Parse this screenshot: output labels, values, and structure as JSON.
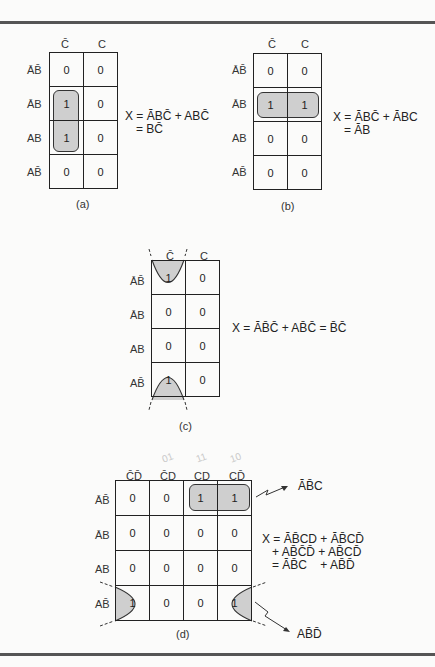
{
  "figure": {
    "panels": [
      {
        "id": "a",
        "caption": "(a)",
        "columns": [
          "C̄",
          "C"
        ],
        "rows": [
          "ĀB̄",
          "ĀB",
          "AB",
          "AB̄"
        ],
        "cells": [
          [
            "0",
            "0"
          ],
          [
            "1",
            "0"
          ],
          [
            "1",
            "0"
          ],
          [
            "0",
            "0"
          ]
        ],
        "expression": [
          "X = ĀBC̄ + ABC̄",
          "= BC̄"
        ]
      },
      {
        "id": "b",
        "caption": "(b)",
        "columns": [
          "C̄",
          "C"
        ],
        "rows": [
          "ĀB̄",
          "ĀB",
          "AB",
          "AB̄"
        ],
        "cells": [
          [
            "0",
            "0"
          ],
          [
            "1",
            "1"
          ],
          [
            "0",
            "0"
          ],
          [
            "0",
            "0"
          ]
        ],
        "expression": [
          "X = ĀBC̄ + ĀBC",
          "= ĀB"
        ]
      },
      {
        "id": "c",
        "caption": "(c)",
        "columns": [
          "C̄",
          "C"
        ],
        "rows": [
          "ĀB̄",
          "ĀB",
          "AB",
          "AB̄"
        ],
        "cells": [
          [
            "1",
            "0"
          ],
          [
            "0",
            "0"
          ],
          [
            "0",
            "0"
          ],
          [
            "1",
            "0"
          ]
        ],
        "expression": [
          "X = ĀB̄C̄ + AB̄C̄ = B̄C̄"
        ]
      },
      {
        "id": "d",
        "caption": "(d)",
        "columns": [
          "C̄D̄",
          "C̄D",
          "CD",
          "CD̄"
        ],
        "column_annotations": [
          "01",
          "11",
          "10"
        ],
        "rows": [
          "ĀB̄",
          "ĀB",
          "AB",
          "AB̄"
        ],
        "cells": [
          [
            "0",
            "0",
            "1",
            "1"
          ],
          [
            "0",
            "0",
            "0",
            "0"
          ],
          [
            "0",
            "0",
            "0",
            "0"
          ],
          [
            "1",
            "0",
            "0",
            "1"
          ]
        ],
        "expression": [
          "X = ĀB̄CD + ĀB̄CD̄",
          "+ AB̄C̄D̄ + AB̄CD̄",
          "= ĀB̄C    + AB̄D̄"
        ],
        "callouts": [
          "ĀB̄C",
          "AB̄D̄"
        ]
      }
    ],
    "colors": {
      "group_fill": "#cfcfcf",
      "rule": "#555555",
      "grid": "#222222"
    }
  }
}
